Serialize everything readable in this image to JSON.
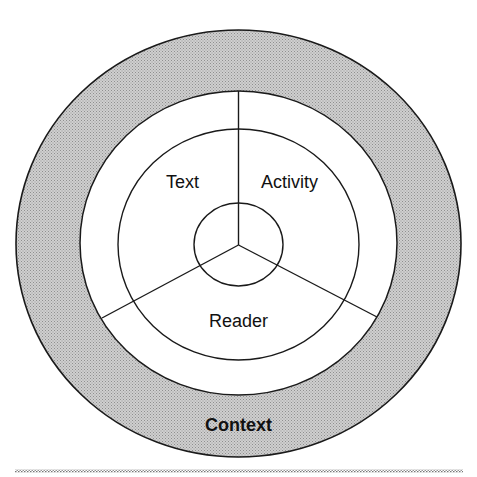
{
  "diagram": {
    "labels": {
      "text": "Text",
      "activity": "Activity",
      "reader": "Reader",
      "context": "Context"
    },
    "colors": {
      "context_ring_fill": "#bdbdbd",
      "stroke": "#1a1a1a",
      "inner_fill": "#ffffff",
      "rule": "#8a8a8a"
    }
  }
}
